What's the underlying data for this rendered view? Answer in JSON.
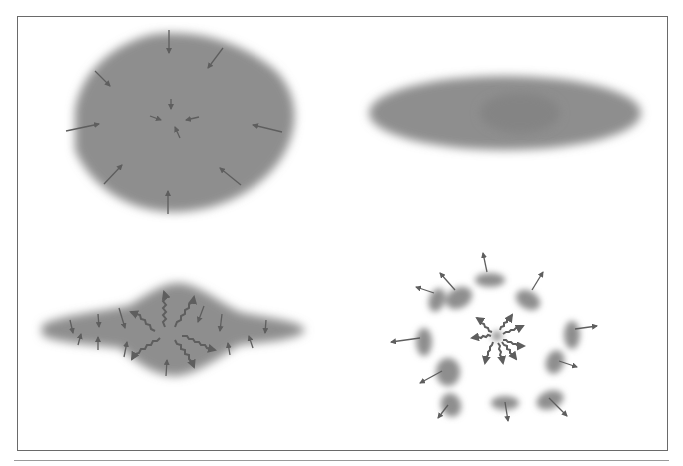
{
  "figure": {
    "colors": {
      "blob": "#8e8e8e",
      "arrow": "#5e5e5e",
      "frame": "#6a6a6a",
      "background": "#ffffff"
    },
    "panels": [
      {
        "id": "top-left",
        "label": "",
        "shape": "large rounded polygonal cloud",
        "arrows": "inward pointing straight arrows (8 outer, 4 central)"
      },
      {
        "id": "top-right",
        "label": "",
        "shape": "elongated ellipse",
        "arrows": "none"
      },
      {
        "id": "bottom-left",
        "label": "",
        "shape": "flattened disk with central bulge",
        "arrows": "wavy outward arrows from center, small vertical inward arrows"
      },
      {
        "id": "bottom-right",
        "label": "",
        "shape": "ring of 12 fragments around central dot",
        "arrows": "outward straight arrows on fragments, wavy outward arrows from center"
      }
    ]
  }
}
